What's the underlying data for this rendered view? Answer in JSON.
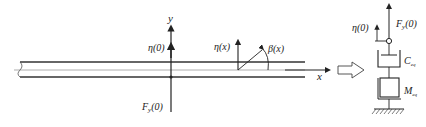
{
  "beam_diagram": {
    "axis_y_label": "y",
    "axis_x_label": "x",
    "eta0_label": "η(0)",
    "etax_label": "η(x)",
    "beta_label": "β(x)",
    "force_label": "F",
    "force_sub": "y",
    "force_arg": "(0)"
  },
  "equivalent_model": {
    "eta0_label": "η(0)",
    "force_label": "F",
    "force_sub": "y",
    "force_arg": "(0)",
    "damper_label": "C",
    "damper_sub": "eq",
    "mass_label": "M",
    "mass_sub": "eq"
  },
  "colors": {
    "line": "#222222",
    "beam_inner": "#888888"
  }
}
